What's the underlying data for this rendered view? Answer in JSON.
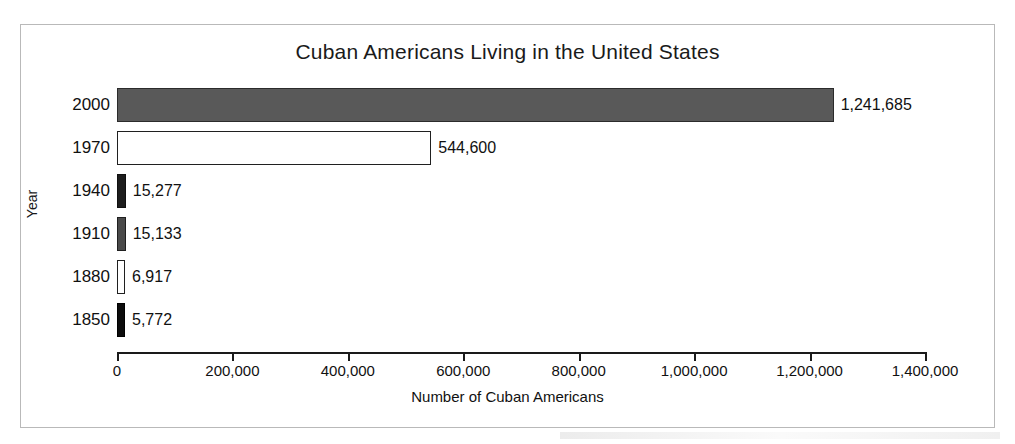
{
  "chart_data": {
    "type": "bar",
    "orientation": "horizontal",
    "title": "Cuban Americans Living in the United States",
    "xlabel": "Number of Cuban Americans",
    "ylabel": "Year",
    "categories": [
      "2000",
      "1970",
      "1940",
      "1910",
      "1880",
      "1850"
    ],
    "values": [
      1241685,
      544600,
      15277,
      15133,
      6917,
      5772
    ],
    "value_labels": [
      "1,241,685",
      "544,600",
      "15,277",
      "15,133",
      "6,917",
      "5,772"
    ],
    "bar_fills": [
      "#595959",
      "#ffffff",
      "#1d1d1d",
      "#4a4a4a",
      "#ffffff",
      "#0c0c0c"
    ],
    "bar_fill_names": [
      "dark-gray",
      "white",
      "near-black",
      "mid-gray",
      "white",
      "black"
    ],
    "xlim": [
      0,
      1400000
    ],
    "xticks": [
      0,
      200000,
      400000,
      600000,
      800000,
      1000000,
      1200000,
      1400000
    ],
    "xtick_labels": [
      "0",
      "200,000",
      "400,000",
      "600,000",
      "800,000",
      "1,000,000",
      "1,200,000",
      "1,400,000"
    ],
    "grid": false,
    "legend": false,
    "frame_color": "#b9b9b9",
    "axis_color": "#1a1a1a",
    "text_color": "#111111"
  },
  "bars": [
    {
      "category": "2000",
      "value": 1241685,
      "label": "1,241,685",
      "fill_class": "fill-dark-gray"
    },
    {
      "category": "1970",
      "value": 544600,
      "label": "544,600",
      "fill_class": "fill-white"
    },
    {
      "category": "1940",
      "value": 15277,
      "label": "15,277",
      "fill_class": "fill-near-black"
    },
    {
      "category": "1910",
      "value": 15133,
      "label": "15,133",
      "fill_class": "fill-mid-gray"
    },
    {
      "category": "1880",
      "value": 6917,
      "label": "6,917",
      "fill_class": "fill-white"
    },
    {
      "category": "1850",
      "value": 5772,
      "label": "5,772",
      "fill_class": "fill-black"
    }
  ],
  "xticks": [
    {
      "value": 0,
      "label": "0"
    },
    {
      "value": 200000,
      "label": "200,000"
    },
    {
      "value": 400000,
      "label": "400,000"
    },
    {
      "value": 600000,
      "label": "600,000"
    },
    {
      "value": 800000,
      "label": "800,000"
    },
    {
      "value": 1000000,
      "label": "1,000,000"
    },
    {
      "value": 1200000,
      "label": "1,200,000"
    },
    {
      "value": 1400000,
      "label": "1,400,000"
    }
  ],
  "geometry": {
    "x_origin_px": 117,
    "x_span_px": 808,
    "x_max_value": 1400000,
    "row_top_px": 88,
    "row_pitch_px": 43,
    "bar_height_px": 34,
    "min_bar_px": 8,
    "value_label_gap_px": 7
  }
}
